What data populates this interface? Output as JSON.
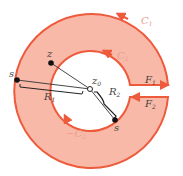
{
  "diagram": {
    "colors": {
      "fill": "#f9b9a8",
      "stroke": "#ee5a3c",
      "line": "#333333",
      "label": "#444444",
      "label_faint": "#e8a090"
    },
    "labels": {
      "C1": {
        "main": "C",
        "sub": "1"
      },
      "C2": {
        "main": "C",
        "sub": "2"
      },
      "negC2": {
        "main": "−C",
        "sub": "2"
      },
      "F1": {
        "main": "F",
        "sub": "1"
      },
      "F2": {
        "main": "F",
        "sub": "2"
      },
      "R1": {
        "main": "R",
        "sub": "1"
      },
      "R2": {
        "main": "R",
        "sub": "2"
      },
      "z": "z",
      "z0": {
        "main": "z",
        "sub": "0"
      },
      "s_left": "s",
      "s_bottom": "s"
    }
  }
}
